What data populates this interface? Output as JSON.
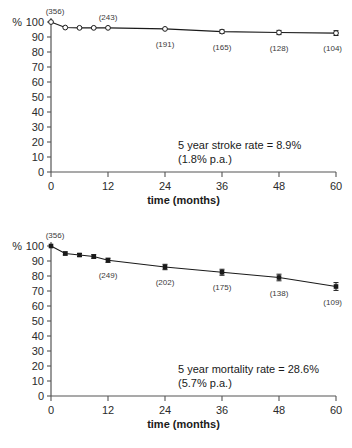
{
  "figures": [
    {
      "id": "stroke",
      "name": "stroke-free-survival-chart",
      "ylabel": "%",
      "xlabel": "time  (months)",
      "annotation_line1": "5 year stroke rate = 8.9%",
      "annotation_line2": "(1.8% p.a.)",
      "marker": "open-circle"
    },
    {
      "id": "mortality",
      "name": "survival-chart",
      "ylabel": "%",
      "xlabel": "time  (months)",
      "annotation_line1": "5 year mortality rate = 28.6%",
      "annotation_line2": "(5.7% p.a.)",
      "marker": "filled-square"
    }
  ],
  "chart_data": [
    {
      "type": "line",
      "title": "",
      "xlabel": "time  (months)",
      "ylabel": "%",
      "xlim": [
        0,
        60
      ],
      "ylim": [
        0,
        100
      ],
      "xticks": [
        0,
        12,
        24,
        36,
        48,
        60
      ],
      "yticks": [
        0,
        10,
        20,
        30,
        40,
        50,
        60,
        70,
        80,
        90,
        100
      ],
      "grid": false,
      "legend": "none",
      "marker_style": "open circle",
      "series": [
        {
          "name": "stroke-free survival",
          "x": [
            0,
            3,
            6,
            9,
            12,
            24,
            36,
            48,
            60
          ],
          "values": [
            100.0,
            96.3,
            96.1,
            96.1,
            96.1,
            95.4,
            93.6,
            93.0,
            92.6
          ],
          "errors": [
            0,
            0,
            0,
            0,
            0,
            0,
            1.2,
            1.4,
            1.6
          ]
        }
      ],
      "point_labels": [
        {
          "x": 0,
          "text": "(356)",
          "position": "above"
        },
        {
          "x": 12,
          "text": "(243)",
          "position": "above"
        },
        {
          "x": 24,
          "text": "(191)",
          "position": "below"
        },
        {
          "x": 36,
          "text": "(165)",
          "position": "below"
        },
        {
          "x": 48,
          "text": "(128)",
          "position": "below"
        },
        {
          "x": 60,
          "text": "(104)",
          "position": "below"
        }
      ],
      "annotations": [
        "5 year stroke rate = 8.9%",
        "(1.8% p.a.)"
      ]
    },
    {
      "type": "line",
      "title": "",
      "xlabel": "time  (months)",
      "ylabel": "%",
      "xlim": [
        0,
        60
      ],
      "ylim": [
        0,
        100
      ],
      "xticks": [
        0,
        12,
        24,
        36,
        48,
        60
      ],
      "yticks": [
        0,
        10,
        20,
        30,
        40,
        50,
        60,
        70,
        80,
        90,
        100
      ],
      "grid": false,
      "legend": "none",
      "marker_style": "filled square",
      "series": [
        {
          "name": "overall survival",
          "x": [
            0,
            3,
            6,
            9,
            12,
            24,
            36,
            48,
            60
          ],
          "values": [
            100.0,
            95.0,
            94.0,
            93.0,
            90.5,
            86.0,
            82.5,
            79.0,
            73.0
          ],
          "errors": [
            0,
            1.0,
            1.0,
            1.2,
            1.4,
            1.8,
            2.0,
            2.2,
            2.6
          ]
        }
      ],
      "point_labels": [
        {
          "x": 0,
          "text": "(356)",
          "position": "above"
        },
        {
          "x": 12,
          "text": "(249)",
          "position": "below"
        },
        {
          "x": 24,
          "text": "(202)",
          "position": "below"
        },
        {
          "x": 36,
          "text": "(175)",
          "position": "below"
        },
        {
          "x": 48,
          "text": "(138)",
          "position": "below"
        },
        {
          "x": 60,
          "text": "(109)",
          "position": "below"
        }
      ],
      "annotations": [
        "5 year mortality rate = 28.6%",
        "(5.7% p.a.)"
      ]
    }
  ],
  "colors": {
    "line": "#1a1a1a",
    "axis": "#555555",
    "text": "#1a1a1a",
    "background": "#ffffff"
  }
}
